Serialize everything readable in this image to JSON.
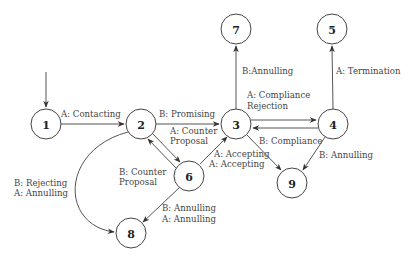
{
  "diagram": {
    "type": "state-transition-graph",
    "nodes": [
      {
        "id": "1",
        "label": "1",
        "x": 46,
        "y": 124
      },
      {
        "id": "2",
        "label": "2",
        "x": 141,
        "y": 124
      },
      {
        "id": "3",
        "label": "3",
        "x": 236,
        "y": 124
      },
      {
        "id": "4",
        "label": "4",
        "x": 333,
        "y": 124
      },
      {
        "id": "5",
        "label": "5",
        "x": 332,
        "y": 29
      },
      {
        "id": "6",
        "label": "6",
        "x": 189,
        "y": 176
      },
      {
        "id": "7",
        "label": "7",
        "x": 236,
        "y": 29
      },
      {
        "id": "8",
        "label": "8",
        "x": 131,
        "y": 233
      },
      {
        "id": "9",
        "label": "9",
        "x": 292,
        "y": 183
      }
    ],
    "edges": [
      {
        "from": "start",
        "to": "1",
        "label": ""
      },
      {
        "from": "1",
        "to": "2",
        "label": "A: Contacting"
      },
      {
        "from": "2",
        "to": "3",
        "label": "B: Promising"
      },
      {
        "from": "2",
        "to": "6",
        "label_lines": [
          "A: Counter",
          "Proposal"
        ]
      },
      {
        "from": "6",
        "to": "2",
        "label_lines": [
          "B: Counter",
          "Proposal"
        ]
      },
      {
        "from": "6",
        "to": "3",
        "label_lines": [
          "A: Accepting",
          "A: Accepting"
        ]
      },
      {
        "from": "6",
        "to": "8",
        "label_lines": [
          "B: Annulling",
          "A: Annulling"
        ]
      },
      {
        "from": "2",
        "to": "8",
        "label_lines": [
          "B: Rejecting",
          "A: Annulling"
        ]
      },
      {
        "from": "3",
        "to": "7",
        "label": "B:Annulling"
      },
      {
        "from": "3",
        "to": "4",
        "label_lines": [
          "A: Compliance",
          "Rejection"
        ]
      },
      {
        "from": "4",
        "to": "3",
        "label": ""
      },
      {
        "from": "4",
        "to": "5",
        "label": "A: Termination"
      },
      {
        "from": "3",
        "to": "9",
        "label": "B: Compliance"
      },
      {
        "from": "4",
        "to": "9",
        "label": "B: Annulling"
      }
    ]
  },
  "labels": {
    "contacting": "A: Contacting",
    "promising": "B: Promising",
    "counter_a_1": "A: Counter",
    "counter_a_2": "Proposal",
    "counter_b_1": "B: Counter",
    "counter_b_2": "Proposal",
    "accepting_1": "A: Accepting",
    "accepting_2": "A: Accepting",
    "annulling68_1": "B: Annulling",
    "annulling68_2": "A: Annulling",
    "rejecting_1": "B: Rejecting",
    "rejecting_2": "A: Annulling",
    "annulling37": "B:Annulling",
    "compliance_rej_1": "A: Compliance",
    "compliance_rej_2": "Rejection",
    "termination": "A: Termination",
    "compliance39": "B: Compliance",
    "annulling49": "B: Annulling"
  },
  "node_labels": {
    "n1": "1",
    "n2": "2",
    "n3": "3",
    "n4": "4",
    "n5": "5",
    "n6": "6",
    "n7": "7",
    "n8": "8",
    "n9": "9"
  }
}
